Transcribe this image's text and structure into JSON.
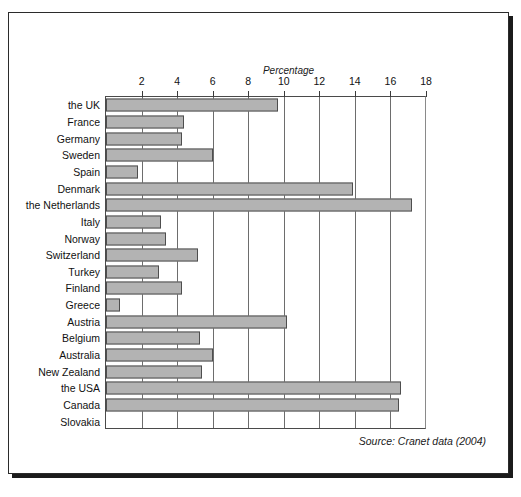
{
  "figure": {
    "top_clipped_text": "",
    "source_note": "Source: Cranet data (2004)"
  },
  "chart_data": {
    "type": "bar",
    "orientation": "horizontal",
    "title": "",
    "xlabel": "Percentage",
    "ylabel": "",
    "xlim": [
      0,
      18
    ],
    "xticks": [
      2,
      4,
      6,
      8,
      10,
      12,
      14,
      16,
      18
    ],
    "grid": true,
    "legend": "none",
    "bar_color": "#b3b3b3",
    "bar_edge_color": "#4e4e4e",
    "categories": [
      "the UK",
      "France",
      "Germany",
      "Sweden",
      "Spain",
      "Denmark",
      "the Netherlands",
      "Italy",
      "Norway",
      "Switzerland",
      "Turkey",
      "Finland",
      "Greece",
      "Austria",
      "Belgium",
      "Australia",
      "New Zealand",
      "the USA",
      "Canada",
      "Slovakia"
    ],
    "values": [
      9.7,
      4.4,
      4.3,
      6.0,
      1.8,
      13.9,
      17.2,
      3.1,
      3.4,
      5.2,
      3.0,
      4.3,
      0.8,
      10.2,
      5.3,
      6.0,
      5.4,
      16.6,
      16.5,
      0.0
    ],
    "annotations": [
      "Source: Cranet data (2004)"
    ]
  }
}
